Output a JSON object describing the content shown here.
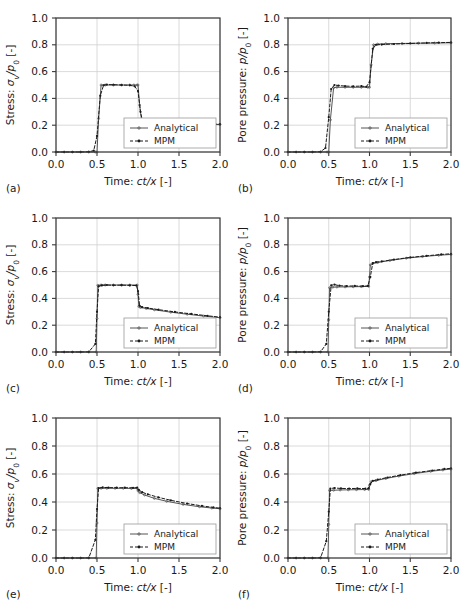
{
  "figure": {
    "layout": "3 rows x 2 columns",
    "background_color": "#ffffff",
    "grid_color": "#d0d0d0",
    "axis_color": "#3a3a3a",
    "series_colors": {
      "analytical": "#555555",
      "mpm": "#1a1a1a"
    }
  },
  "axes": {
    "x": {
      "label_prefix": "Time: ",
      "label_math": "ct/x",
      "label_suffix": " [-]",
      "ticks": [
        "0.0",
        "0.5",
        "1.0",
        "1.5",
        "2.0"
      ],
      "tick_values": [
        0.0,
        0.5,
        1.0,
        1.5,
        2.0
      ],
      "lim": [
        0.0,
        2.0
      ]
    },
    "y_stress": {
      "label_prefix": "Stress: ",
      "label_math": "σ",
      "label_sub": "v",
      "label_math2": "/p",
      "label_sub2": "0",
      "label_suffix": " [-]",
      "ticks": [
        "0.0",
        "0.2",
        "0.4",
        "0.6",
        "0.8",
        "1.0"
      ],
      "tick_values": [
        0.0,
        0.2,
        0.4,
        0.6,
        0.8,
        1.0
      ],
      "lim": [
        0.0,
        1.0
      ]
    },
    "y_pressure": {
      "label_prefix": "Pore pressure: ",
      "label_math": "p",
      "label_math2": "/p",
      "label_sub2": "0",
      "label_suffix": " [-]",
      "ticks": [
        "0.0",
        "0.2",
        "0.4",
        "0.6",
        "0.8",
        "1.0"
      ],
      "tick_values": [
        0.0,
        0.2,
        0.4,
        0.6,
        0.8,
        1.0
      ],
      "lim": [
        0.0,
        1.0
      ]
    }
  },
  "legend": {
    "entries": [
      {
        "label": "Analytical",
        "style": "solid",
        "marker": "dot-open"
      },
      {
        "label": "MPM",
        "style": "dashed",
        "marker": "dot-filled"
      }
    ]
  },
  "chart_data": [
    {
      "type": "line",
      "tag": "(a)",
      "title": "",
      "xlabel": "Time: ct/x [-]",
      "ylabel": "Stress: σv/p0 [-]",
      "xlim": [
        0.0,
        2.0
      ],
      "ylim": [
        0.0,
        1.0
      ],
      "grid": true,
      "legend_position": "lower right",
      "series": [
        {
          "name": "Analytical",
          "x": [
            0.0,
            0.1,
            0.2,
            0.3,
            0.4,
            0.48,
            0.5,
            0.52,
            0.55,
            0.6,
            0.7,
            0.8,
            0.9,
            0.95,
            0.99,
            1.0,
            1.02,
            1.05,
            1.1,
            1.2,
            1.4,
            1.6,
            1.8,
            2.0
          ],
          "y": [
            0.0,
            0.0,
            0.0,
            0.0,
            0.0,
            0.0,
            0.0,
            0.25,
            0.5,
            0.5,
            0.5,
            0.5,
            0.5,
            0.5,
            0.5,
            0.5,
            0.35,
            0.205,
            0.205,
            0.205,
            0.205,
            0.205,
            0.205,
            0.205
          ]
        },
        {
          "name": "MPM",
          "x": [
            0.0,
            0.1,
            0.2,
            0.3,
            0.4,
            0.46,
            0.5,
            0.54,
            0.58,
            0.62,
            0.7,
            0.8,
            0.9,
            0.96,
            1.0,
            1.03,
            1.06,
            1.1,
            1.2,
            1.4,
            1.6,
            1.8,
            2.0
          ],
          "y": [
            0.0,
            0.0,
            0.0,
            0.0,
            0.002,
            0.01,
            0.12,
            0.42,
            0.498,
            0.503,
            0.502,
            0.5,
            0.498,
            0.49,
            0.455,
            0.3,
            0.215,
            0.208,
            0.206,
            0.207,
            0.206,
            0.207,
            0.208
          ]
        }
      ]
    },
    {
      "type": "line",
      "tag": "(b)",
      "title": "",
      "xlabel": "Time: ct/x [-]",
      "ylabel": "Pore pressure: p/p0 [-]",
      "xlim": [
        0.0,
        2.0
      ],
      "ylim": [
        0.0,
        1.0
      ],
      "grid": true,
      "legend_position": "lower right",
      "series": [
        {
          "name": "Analytical",
          "x": [
            0.0,
            0.1,
            0.2,
            0.3,
            0.4,
            0.48,
            0.5,
            0.52,
            0.56,
            0.6,
            0.7,
            0.8,
            0.9,
            0.98,
            1.0,
            1.02,
            1.05,
            1.1,
            1.2,
            1.4,
            1.6,
            1.8,
            2.0
          ],
          "y": [
            0.0,
            0.0,
            0.0,
            0.0,
            0.0,
            0.0,
            0.0,
            0.24,
            0.48,
            0.483,
            0.483,
            0.483,
            0.483,
            0.483,
            0.483,
            0.65,
            0.8,
            0.805,
            0.808,
            0.81,
            0.812,
            0.813,
            0.815
          ]
        },
        {
          "name": "MPM",
          "x": [
            0.0,
            0.1,
            0.2,
            0.3,
            0.4,
            0.46,
            0.5,
            0.53,
            0.57,
            0.62,
            0.7,
            0.8,
            0.9,
            0.96,
            1.0,
            1.04,
            1.08,
            1.15,
            1.3,
            1.5,
            1.7,
            1.85,
            2.0
          ],
          "y": [
            0.0,
            0.0,
            0.0,
            0.0,
            0.002,
            0.03,
            0.26,
            0.47,
            0.5,
            0.496,
            0.492,
            0.49,
            0.492,
            0.487,
            0.52,
            0.77,
            0.8,
            0.802,
            0.806,
            0.81,
            0.814,
            0.816,
            0.818
          ]
        }
      ]
    },
    {
      "type": "line",
      "tag": "(c)",
      "title": "",
      "xlabel": "Time: ct/x [-]",
      "ylabel": "Stress: σv/p0 [-]",
      "xlim": [
        0.0,
        2.0
      ],
      "ylim": [
        0.0,
        1.0
      ],
      "grid": true,
      "legend_position": "lower right",
      "series": [
        {
          "name": "Analytical",
          "x": [
            0.0,
            0.1,
            0.2,
            0.3,
            0.4,
            0.49,
            0.5,
            0.51,
            0.55,
            0.6,
            0.7,
            0.8,
            0.9,
            0.99,
            1.0,
            1.01,
            1.03,
            1.1,
            1.2,
            1.4,
            1.6,
            1.8,
            2.0
          ],
          "y": [
            0.0,
            0.0,
            0.0,
            0.0,
            0.0,
            0.0,
            0.25,
            0.498,
            0.5,
            0.5,
            0.5,
            0.5,
            0.5,
            0.5,
            0.43,
            0.34,
            0.332,
            0.325,
            0.315,
            0.297,
            0.282,
            0.268,
            0.256
          ]
        },
        {
          "name": "MPM",
          "x": [
            0.0,
            0.1,
            0.2,
            0.3,
            0.4,
            0.48,
            0.5,
            0.52,
            0.56,
            0.62,
            0.7,
            0.8,
            0.9,
            0.98,
            1.0,
            1.02,
            1.05,
            1.12,
            1.25,
            1.45,
            1.65,
            1.85,
            2.0
          ],
          "y": [
            0.0,
            0.0,
            0.0,
            0.0,
            0.001,
            0.06,
            0.3,
            0.49,
            0.497,
            0.5,
            0.498,
            0.499,
            0.497,
            0.496,
            0.455,
            0.345,
            0.335,
            0.328,
            0.316,
            0.299,
            0.284,
            0.27,
            0.26
          ]
        }
      ]
    },
    {
      "type": "line",
      "tag": "(d)",
      "title": "",
      "xlabel": "Time: ct/x [-]",
      "ylabel": "Pore pressure: p/p0 [-]",
      "xlim": [
        0.0,
        2.0
      ],
      "ylim": [
        0.0,
        1.0
      ],
      "grid": true,
      "legend_position": "lower right",
      "series": [
        {
          "name": "Analytical",
          "x": [
            0.0,
            0.1,
            0.2,
            0.3,
            0.4,
            0.49,
            0.5,
            0.51,
            0.55,
            0.6,
            0.7,
            0.8,
            0.9,
            0.99,
            1.0,
            1.01,
            1.04,
            1.1,
            1.25,
            1.45,
            1.65,
            1.85,
            2.0
          ],
          "y": [
            0.0,
            0.0,
            0.0,
            0.0,
            0.0,
            0.0,
            0.24,
            0.48,
            0.484,
            0.485,
            0.486,
            0.487,
            0.488,
            0.49,
            0.56,
            0.65,
            0.66,
            0.668,
            0.683,
            0.7,
            0.712,
            0.722,
            0.728
          ]
        },
        {
          "name": "MPM",
          "x": [
            0.0,
            0.1,
            0.2,
            0.3,
            0.4,
            0.47,
            0.5,
            0.53,
            0.57,
            0.63,
            0.72,
            0.82,
            0.92,
            0.98,
            1.01,
            1.04,
            1.08,
            1.15,
            1.3,
            1.5,
            1.7,
            1.88,
            2.0
          ],
          "y": [
            0.0,
            0.0,
            0.0,
            0.0,
            0.002,
            0.06,
            0.3,
            0.498,
            0.503,
            0.495,
            0.492,
            0.493,
            0.491,
            0.493,
            0.56,
            0.664,
            0.67,
            0.676,
            0.69,
            0.706,
            0.718,
            0.728,
            0.733
          ]
        }
      ]
    },
    {
      "type": "line",
      "tag": "(e)",
      "title": "",
      "xlabel": "Time: ct/x [-]",
      "ylabel": "Stress: σv/p0 [-]",
      "xlim": [
        0.0,
        2.0
      ],
      "ylim": [
        0.0,
        1.0
      ],
      "grid": true,
      "legend_position": "lower right",
      "series": [
        {
          "name": "Analytical",
          "x": [
            0.0,
            0.1,
            0.2,
            0.3,
            0.4,
            0.49,
            0.5,
            0.51,
            0.55,
            0.62,
            0.72,
            0.82,
            0.92,
            0.99,
            1.0,
            1.02,
            1.08,
            1.2,
            1.35,
            1.55,
            1.75,
            1.9,
            2.0
          ],
          "y": [
            0.0,
            0.0,
            0.0,
            0.0,
            0.0,
            0.0,
            0.25,
            0.497,
            0.498,
            0.498,
            0.498,
            0.498,
            0.497,
            0.497,
            0.48,
            0.467,
            0.45,
            0.426,
            0.405,
            0.383,
            0.366,
            0.357,
            0.352
          ]
        },
        {
          "name": "MPM",
          "x": [
            0.0,
            0.1,
            0.2,
            0.3,
            0.4,
            0.48,
            0.5,
            0.52,
            0.57,
            0.64,
            0.74,
            0.84,
            0.94,
            0.99,
            1.01,
            1.05,
            1.12,
            1.25,
            1.4,
            1.6,
            1.78,
            1.92,
            2.0
          ],
          "y": [
            0.0,
            0.0,
            0.0,
            0.0,
            0.001,
            0.13,
            0.35,
            0.5,
            0.504,
            0.503,
            0.502,
            0.502,
            0.501,
            0.503,
            0.487,
            0.47,
            0.455,
            0.433,
            0.412,
            0.389,
            0.372,
            0.361,
            0.356
          ]
        }
      ]
    },
    {
      "type": "line",
      "tag": "(f)",
      "title": "",
      "xlabel": "Time: ct/x [-]",
      "ylabel": "Pore pressure: p/p0 [-]",
      "xlim": [
        0.0,
        2.0
      ],
      "ylim": [
        0.0,
        1.0
      ],
      "grid": true,
      "legend_position": "lower right",
      "series": [
        {
          "name": "Analytical",
          "x": [
            0.0,
            0.1,
            0.2,
            0.3,
            0.4,
            0.49,
            0.5,
            0.51,
            0.56,
            0.64,
            0.74,
            0.84,
            0.94,
            0.99,
            1.0,
            1.02,
            1.08,
            1.2,
            1.36,
            1.55,
            1.75,
            1.9,
            2.0
          ],
          "y": [
            0.0,
            0.0,
            0.0,
            0.0,
            0.0,
            0.0,
            0.24,
            0.483,
            0.484,
            0.486,
            0.487,
            0.488,
            0.489,
            0.49,
            0.52,
            0.545,
            0.553,
            0.568,
            0.585,
            0.603,
            0.619,
            0.629,
            0.635
          ]
        },
        {
          "name": "MPM",
          "x": [
            0.0,
            0.1,
            0.2,
            0.3,
            0.4,
            0.47,
            0.5,
            0.52,
            0.57,
            0.65,
            0.75,
            0.85,
            0.95,
            0.99,
            1.01,
            1.04,
            1.1,
            1.22,
            1.38,
            1.57,
            1.77,
            1.92,
            2.0
          ],
          "y": [
            0.0,
            0.0,
            0.0,
            0.0,
            0.002,
            0.12,
            0.33,
            0.496,
            0.5,
            0.497,
            0.496,
            0.497,
            0.496,
            0.498,
            0.528,
            0.551,
            0.56,
            0.575,
            0.592,
            0.61,
            0.625,
            0.636,
            0.641
          ]
        }
      ]
    }
  ]
}
